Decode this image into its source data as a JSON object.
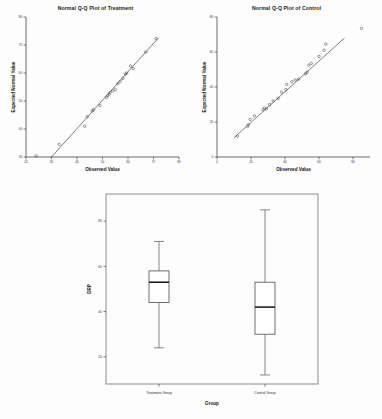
{
  "figure": {
    "background": "#fdfdfd",
    "marker_color": "#4a4a4a",
    "line_color": "#2f2f2f"
  },
  "chart_data": [
    {
      "type": "scatter",
      "id": "qq-treatment",
      "title": "Normal Q-Q Plot of Treatment",
      "xlabel": "Observed Value",
      "ylabel": "Expected Normal Value",
      "xlim": [
        20,
        80
      ],
      "ylim": [
        30,
        80
      ],
      "xticks": [
        20,
        30,
        40,
        50,
        60,
        70,
        80
      ],
      "yticks": [
        30,
        40,
        50,
        60,
        70,
        80
      ],
      "grid": false,
      "legend": "none",
      "reference_line": {
        "x": [
          30.0,
          72.0
        ],
        "y": [
          30.0,
          72.6
        ]
      },
      "points": [
        {
          "x": 24.0,
          "y": 30.4
        },
        {
          "x": 33.0,
          "y": 34.5
        },
        {
          "x": 43.0,
          "y": 41.0
        },
        {
          "x": 44.0,
          "y": 44.4
        },
        {
          "x": 46.0,
          "y": 46.5
        },
        {
          "x": 46.5,
          "y": 46.9
        },
        {
          "x": 49.0,
          "y": 48.4
        },
        {
          "x": 51.5,
          "y": 51.3
        },
        {
          "x": 52.0,
          "y": 51.9
        },
        {
          "x": 52.5,
          "y": 52.4
        },
        {
          "x": 53.0,
          "y": 53.0
        },
        {
          "x": 54.0,
          "y": 53.6
        },
        {
          "x": 55.0,
          "y": 54.1
        },
        {
          "x": 56.0,
          "y": 56.2
        },
        {
          "x": 57.0,
          "y": 57.0
        },
        {
          "x": 58.0,
          "y": 58.1
        },
        {
          "x": 59.0,
          "y": 59.6
        },
        {
          "x": 59.5,
          "y": 60.0
        },
        {
          "x": 61.0,
          "y": 62.5
        },
        {
          "x": 62.0,
          "y": 61.6
        },
        {
          "x": 67.0,
          "y": 67.5
        },
        {
          "x": 71.0,
          "y": 72.3
        }
      ]
    },
    {
      "type": "scatter",
      "id": "qq-control",
      "title": "Normal Q-Q Plot of Control",
      "xlabel": "Observed Value",
      "ylabel": "Expected Normal Value",
      "xlim": [
        0,
        90
      ],
      "ylim": [
        0,
        80
      ],
      "xticks": [
        0,
        20,
        40,
        60,
        80
      ],
      "yticks": [
        0,
        20,
        40,
        60,
        80
      ],
      "grid": false,
      "legend": "none",
      "reference_line": {
        "x": [
          10.0,
          75.0
        ],
        "y": [
          11.0,
          68.0
        ]
      },
      "points": [
        {
          "x": 12.0,
          "y": 12.0
        },
        {
          "x": 18.0,
          "y": 17.5
        },
        {
          "x": 18.5,
          "y": 18.5
        },
        {
          "x": 19.5,
          "y": 21.5
        },
        {
          "x": 22.0,
          "y": 23.5
        },
        {
          "x": 27.0,
          "y": 27.0
        },
        {
          "x": 28.0,
          "y": 28.0
        },
        {
          "x": 29.0,
          "y": 27.5
        },
        {
          "x": 31.0,
          "y": 30.0
        },
        {
          "x": 33.0,
          "y": 32.0
        },
        {
          "x": 36.0,
          "y": 33.5
        },
        {
          "x": 38.0,
          "y": 37.0
        },
        {
          "x": 40.5,
          "y": 38.5
        },
        {
          "x": 41.0,
          "y": 41.5
        },
        {
          "x": 44.0,
          "y": 43.0
        },
        {
          "x": 46.0,
          "y": 44.0
        },
        {
          "x": 48.0,
          "y": 44.5
        },
        {
          "x": 52.0,
          "y": 47.5
        },
        {
          "x": 53.0,
          "y": 48.5
        },
        {
          "x": 54.0,
          "y": 52.5
        },
        {
          "x": 55.5,
          "y": 53.5
        },
        {
          "x": 60.0,
          "y": 57.5
        },
        {
          "x": 63.0,
          "y": 61.0
        },
        {
          "x": 64.0,
          "y": 64.5
        },
        {
          "x": 85.0,
          "y": 73.5
        }
      ]
    },
    {
      "type": "box",
      "id": "boxplot-drp",
      "title": "",
      "xlabel": "Group",
      "ylabel": "DRP",
      "ylim": [
        8,
        92
      ],
      "yticks": [
        20,
        40,
        60,
        80
      ],
      "grid": false,
      "legend": "none",
      "categories": [
        "Treatment Group",
        "Control Group"
      ],
      "boxes": [
        {
          "label": "Treatment Group",
          "whisker_low": 24.0,
          "q1": 44.0,
          "median": 53.0,
          "q3": 58.0,
          "whisker_high": 71.0
        },
        {
          "label": "Control Group",
          "whisker_low": 12.0,
          "q1": 30.0,
          "median": 42.0,
          "q3": 53.0,
          "whisker_high": 85.0
        }
      ]
    }
  ]
}
